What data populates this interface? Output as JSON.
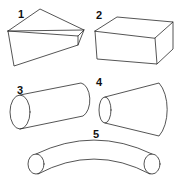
{
  "figure": {
    "stroke_color": "#2a2a2a",
    "background": "#ffffff",
    "shapes": [
      {
        "number": "1",
        "label": "1",
        "kind": "wedge / tapered prism"
      },
      {
        "number": "2",
        "label": "2",
        "kind": "rectangular box"
      },
      {
        "number": "3",
        "label": "3",
        "kind": "cylinder"
      },
      {
        "number": "4",
        "label": "4",
        "kind": "truncated cone (frustum)"
      },
      {
        "number": "5",
        "label": "5",
        "kind": "curved tube / torus segment"
      }
    ]
  }
}
